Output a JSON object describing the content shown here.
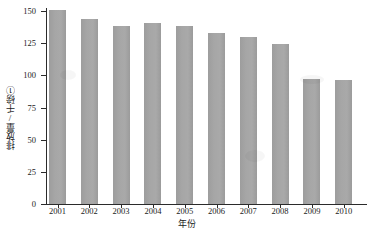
{
  "chart_data": {
    "type": "bar",
    "title": "",
    "subtitle": "",
    "xlabel": "年份",
    "ylabel": "排放量/千磅①",
    "categories": [
      "2001",
      "2002",
      "2003",
      "2004",
      "2005",
      "2006",
      "2007",
      "2008",
      "2009",
      "2010"
    ],
    "values": [
      151,
      144,
      138,
      141,
      138,
      133,
      130,
      124,
      97,
      96.5
    ],
    "series": [
      {
        "name": "排放量",
        "values": [
          151,
          144,
          138,
          141,
          138,
          133,
          130,
          124,
          97,
          96.5
        ]
      }
    ],
    "ylim": [
      0,
      152
    ],
    "yticks": [
      0,
      25,
      50,
      75,
      100,
      125,
      150
    ],
    "ytick_labels": [
      "0",
      "25",
      "50",
      "75",
      "100",
      "125",
      "150"
    ],
    "xlim_categories": 10,
    "grid": false,
    "legend": null,
    "legend_position": "none",
    "bar_color": "#a5a5a5",
    "axis_color": "#2b2b2b",
    "background": "#ffffff",
    "annotations": []
  },
  "axes": {
    "y_title": "排放量/千磅①",
    "x_title": "年份"
  }
}
